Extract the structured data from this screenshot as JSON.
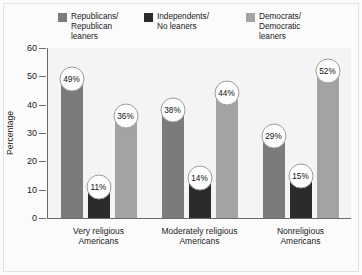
{
  "chart_data": {
    "type": "bar",
    "title": "",
    "xlabel": "",
    "ylabel": "Percentage",
    "ylim": [
      0,
      60
    ],
    "yticks": [
      0,
      10,
      20,
      30,
      40,
      50,
      60
    ],
    "ytick_labels": [
      "0",
      "10",
      "20",
      "30",
      "40",
      "50",
      "60"
    ],
    "grid": false,
    "legend_position": "top",
    "categories": [
      "Very religious\nAmericans",
      "Moderately religious\nAmericans",
      "Nonreligious\nAmericans"
    ],
    "series": [
      {
        "name": "Republicans/\nRepublican\nleaners",
        "color": "#7b7b7b",
        "values": [
          49,
          38,
          29
        ],
        "value_labels": [
          "49%",
          "38%",
          "29%"
        ]
      },
      {
        "name": "Independents/\nNo leaners",
        "color": "#2b2b2b",
        "values": [
          11,
          14,
          15
        ],
        "value_labels": [
          "11%",
          "14%",
          "15%"
        ]
      },
      {
        "name": "Democrats/\nDemocratic\nleaners",
        "color": "#a3a3a3",
        "values": [
          36,
          44,
          52
        ],
        "value_labels": [
          "36%",
          "44%",
          "52%"
        ]
      }
    ]
  },
  "colors": {
    "figure_background": "#fbfbfb",
    "plot_background": "#f4f4f4",
    "axis_line": "#6b6b6b",
    "text": "#1b1b1b",
    "bubble_fill": "#fdfdfd",
    "bubble_border": "#9c9c9c",
    "republican_gray": "#7b7b7b",
    "independent_dark": "#2b2b2b",
    "democrat_light": "#a3a3a3"
  }
}
